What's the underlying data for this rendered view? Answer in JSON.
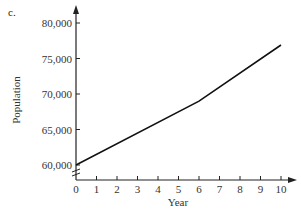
{
  "part_label": "c.",
  "chart_data": {
    "type": "line",
    "title": "",
    "xlabel": "Year",
    "ylabel": "Population",
    "x_ticks": [
      "0",
      "1",
      "2",
      "3",
      "4",
      "5",
      "6",
      "7",
      "8",
      "9",
      "10"
    ],
    "y_ticks": [
      "60,000",
      "65,000",
      "70,000",
      "75,000",
      "80,000"
    ],
    "xlim": [
      0,
      10
    ],
    "ylim": [
      60000,
      80000
    ],
    "y_axis_break": true,
    "grid": false,
    "series": [
      {
        "name": "Population",
        "x": [
          0,
          6,
          10
        ],
        "values": [
          60000,
          69000,
          76900
        ]
      }
    ]
  }
}
